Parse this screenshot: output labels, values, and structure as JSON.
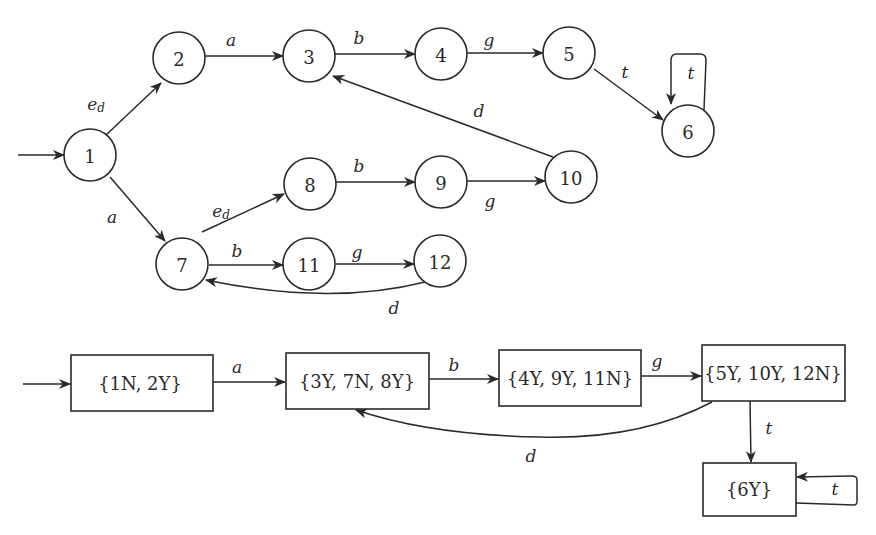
{
  "diagram": {
    "type": "automaton_and_subset_construction",
    "colors": {
      "stroke": "#2a2a2a",
      "background": "#ffffff"
    },
    "automaton": {
      "initial_state": "1",
      "states": [
        {
          "id": "1",
          "label": "1"
        },
        {
          "id": "2",
          "label": "2"
        },
        {
          "id": "3",
          "label": "3"
        },
        {
          "id": "4",
          "label": "4"
        },
        {
          "id": "5",
          "label": "5"
        },
        {
          "id": "6",
          "label": "6"
        },
        {
          "id": "7",
          "label": "7"
        },
        {
          "id": "8",
          "label": "8"
        },
        {
          "id": "9",
          "label": "9"
        },
        {
          "id": "10",
          "label": "10"
        },
        {
          "id": "11",
          "label": "11"
        },
        {
          "id": "12",
          "label": "12"
        }
      ],
      "transitions": [
        {
          "from": "1",
          "to": "2",
          "label": "e",
          "subscript": "d"
        },
        {
          "from": "1",
          "to": "7",
          "label": "a"
        },
        {
          "from": "2",
          "to": "3",
          "label": "a"
        },
        {
          "from": "3",
          "to": "4",
          "label": "b"
        },
        {
          "from": "4",
          "to": "5",
          "label": "g"
        },
        {
          "from": "5",
          "to": "6",
          "label": "t"
        },
        {
          "from": "6",
          "to": "6",
          "label": "t"
        },
        {
          "from": "10",
          "to": "3",
          "label": "d"
        },
        {
          "from": "7",
          "to": "8",
          "label": "e",
          "subscript": "d"
        },
        {
          "from": "8",
          "to": "9",
          "label": "b"
        },
        {
          "from": "9",
          "to": "10",
          "label": "g"
        },
        {
          "from": "7",
          "to": "11",
          "label": "b"
        },
        {
          "from": "11",
          "to": "12",
          "label": "g"
        },
        {
          "from": "12",
          "to": "7",
          "label": "d"
        }
      ]
    },
    "observer": {
      "initial_state": "{1N, 2Y}",
      "states": [
        {
          "id": "A",
          "label": "{1N, 2Y}"
        },
        {
          "id": "B",
          "label": "{3Y, 7N, 8Y}"
        },
        {
          "id": "C",
          "label": "{4Y, 9Y, 11N}"
        },
        {
          "id": "D",
          "label": "{5Y, 10Y, 12N}"
        },
        {
          "id": "E",
          "label": "{6Y}"
        }
      ],
      "transitions": [
        {
          "from": "A",
          "to": "B",
          "label": "a"
        },
        {
          "from": "B",
          "to": "C",
          "label": "b"
        },
        {
          "from": "C",
          "to": "D",
          "label": "g"
        },
        {
          "from": "D",
          "to": "B",
          "label": "d"
        },
        {
          "from": "D",
          "to": "E",
          "label": "t"
        },
        {
          "from": "E",
          "to": "E",
          "label": "t"
        }
      ]
    }
  }
}
